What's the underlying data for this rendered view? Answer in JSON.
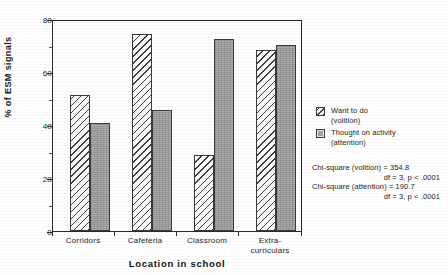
{
  "chart_data": {
    "type": "bar",
    "title": "",
    "subtitle": "",
    "xlabel": "Location in school",
    "ylabel": "% of ESM signals",
    "categories": [
      "Corridors",
      "Cafeteria",
      "Classroom",
      "Extra-curriculars"
    ],
    "category_lines": [
      [
        "Corridors"
      ],
      [
        "Cafeteria"
      ],
      [
        "Classroom"
      ],
      [
        "Extra-",
        "curriculars"
      ]
    ],
    "series": [
      {
        "name": "Want to do (volition)",
        "name_line1": "Want to do",
        "name_line2": "(volition)",
        "fill": "diagonal-hatch",
        "values": [
          52,
          75,
          29,
          69
        ]
      },
      {
        "name": "Thought on activity (attention)",
        "name_line1": "Thought on activity",
        "name_line2": "(attention)",
        "fill": "solid-gray",
        "values": [
          41,
          46,
          73,
          71
        ]
      }
    ],
    "ylim": [
      0,
      80
    ],
    "yticks": [
      0,
      20,
      40,
      60,
      80
    ],
    "ytick_labels": [
      "0",
      "20",
      "40",
      "60",
      "80"
    ],
    "yminor_ticks": [
      10,
      30,
      50,
      70
    ],
    "grid": false,
    "legend_position": "right",
    "annotations": [
      "Chi-square (volition) = 354.8",
      "df = 3, p < .0001",
      "Chi-square (attention) = 190.7",
      "df = 3, p < .0001"
    ]
  },
  "stats": {
    "volition_line": "Chi-square  (volition)  =  354.8",
    "volition_df": "df = 3, p < .0001",
    "attention_line": "Chi-square  (attention)  =  190.7",
    "attention_df": "df = 3, p < .0001"
  },
  "colors": {
    "axis": "#2a2a2a",
    "bar_attention": "#9c9c9c",
    "bar_volition": "#fdfdfd",
    "text": "#1b1b1b",
    "background": "#ffffff"
  }
}
